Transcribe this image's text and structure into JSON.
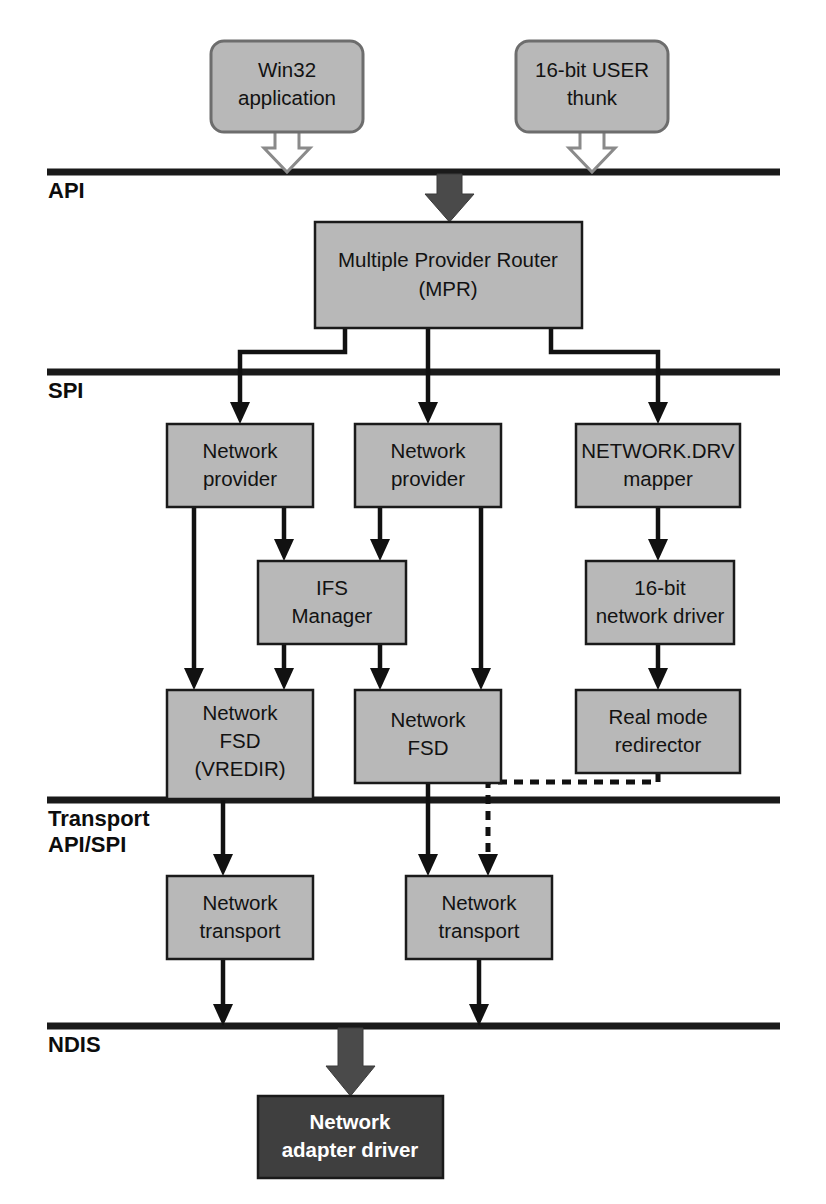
{
  "diagram": {
    "colors": {
      "box_fill": "#b8b8b8",
      "box_stroke": "#1a1a1a",
      "dark_box_fill": "#3f3f3f",
      "dark_box_text": "#ffffff",
      "rule": "#1a1a1a",
      "connector": "#111111",
      "hollow_arrow_fill": "#ffffff",
      "hollow_arrow_stroke": "#8a8a8a",
      "filled_block_arrow": "#4a4a4a",
      "background": "#ffffff"
    },
    "layers": [
      {
        "id": "api",
        "label": "API",
        "rule_y": 172,
        "label_y": 190
      },
      {
        "id": "spi",
        "label": "SPI",
        "rule_y": 372,
        "label_y": 390
      },
      {
        "id": "transport",
        "label": "Transport",
        "label2": "API/SPI",
        "rule_y": 800,
        "label_y": 818,
        "label2_y": 844
      },
      {
        "id": "ndis",
        "label": "NDIS",
        "rule_y": 1026,
        "label_y": 1045
      }
    ],
    "nodes": [
      {
        "id": "win32-application",
        "line1": "Win32",
        "line2": "application",
        "shape": "rounded",
        "x": 211,
        "y": 41,
        "w": 152,
        "h": 91
      },
      {
        "id": "sixteen-bit-user-thunk",
        "line1": "16-bit USER",
        "line2": "thunk",
        "shape": "rounded",
        "x": 516,
        "y": 41,
        "w": 152,
        "h": 91
      },
      {
        "id": "multiple-provider-router",
        "line1": "Multiple Provider Router",
        "line2": "(MPR)",
        "shape": "rect",
        "x": 315,
        "y": 222,
        "w": 267,
        "h": 106
      },
      {
        "id": "network-provider-left",
        "line1": "Network",
        "line2": "provider",
        "shape": "rect",
        "x": 167,
        "y": 424,
        "w": 146,
        "h": 83
      },
      {
        "id": "network-provider-center",
        "line1": "Network",
        "line2": "provider",
        "shape": "rect",
        "x": 355,
        "y": 424,
        "w": 146,
        "h": 83
      },
      {
        "id": "network-drv-mapper",
        "line1": "NETWORK.DRV",
        "line2": "mapper",
        "shape": "rect",
        "x": 576,
        "y": 424,
        "w": 164,
        "h": 83
      },
      {
        "id": "ifs-manager",
        "line1": "IFS",
        "line2": "Manager",
        "shape": "rect",
        "x": 258,
        "y": 561,
        "w": 148,
        "h": 83
      },
      {
        "id": "sixteen-bit-network-driver",
        "line1": "16-bit",
        "line2": "network driver",
        "shape": "rect",
        "x": 586,
        "y": 561,
        "w": 148,
        "h": 83
      },
      {
        "id": "network-fsd-vredir",
        "line1": "Network",
        "line2": "FSD",
        "line3": "(VREDIR)",
        "shape": "rect",
        "x": 167,
        "y": 690,
        "w": 146,
        "h": 109
      },
      {
        "id": "network-fsd",
        "line1": "Network",
        "line2": "FSD",
        "shape": "rect",
        "x": 355,
        "y": 690,
        "w": 146,
        "h": 93
      },
      {
        "id": "real-mode-redirector",
        "line1": "Real mode",
        "line2": "redirector",
        "shape": "rect",
        "x": 576,
        "y": 690,
        "w": 164,
        "h": 83
      },
      {
        "id": "network-transport-left",
        "line1": "Network",
        "line2": "transport",
        "shape": "rect",
        "x": 167,
        "y": 876,
        "w": 146,
        "h": 83
      },
      {
        "id": "network-transport-right",
        "line1": "Network",
        "line2": "transport",
        "shape": "rect",
        "x": 406,
        "y": 876,
        "w": 146,
        "h": 83
      },
      {
        "id": "network-adapter-driver",
        "line1": "Network",
        "line2": "adapter driver",
        "shape": "dark",
        "x": 258,
        "y": 1096,
        "w": 185,
        "h": 82
      }
    ],
    "connectors": [
      {
        "id": "win32-to-api",
        "kind": "block-arrow-hollow",
        "from": "win32-application",
        "to": "api-layer"
      },
      {
        "id": "thunk-to-api",
        "kind": "block-arrow-hollow",
        "from": "sixteen-bit-user-thunk",
        "to": "api-layer"
      },
      {
        "id": "api-to-mpr",
        "kind": "block-arrow-filled",
        "from": "api-layer",
        "to": "multiple-provider-router"
      },
      {
        "id": "mpr-to-network-provider-left",
        "kind": "elbow-arrow",
        "from": "multiple-provider-router",
        "to": "network-provider-left"
      },
      {
        "id": "mpr-to-network-provider-center",
        "kind": "straight-arrow",
        "from": "multiple-provider-router",
        "to": "network-provider-center"
      },
      {
        "id": "mpr-to-network-drv-mapper",
        "kind": "elbow-arrow",
        "from": "multiple-provider-router",
        "to": "network-drv-mapper"
      },
      {
        "id": "network-provider-left-to-fsd-vredir",
        "kind": "straight-arrow",
        "from": "network-provider-left",
        "to": "network-fsd-vredir"
      },
      {
        "id": "network-provider-left-to-ifs-manager",
        "kind": "straight-arrow",
        "from": "network-provider-left",
        "to": "ifs-manager"
      },
      {
        "id": "network-provider-center-to-ifs-manager",
        "kind": "straight-arrow",
        "from": "network-provider-center",
        "to": "ifs-manager"
      },
      {
        "id": "network-provider-center-to-network-fsd",
        "kind": "straight-arrow",
        "from": "network-provider-center",
        "to": "network-fsd"
      },
      {
        "id": "ifs-manager-to-fsd-vredir",
        "kind": "straight-arrow",
        "from": "ifs-manager",
        "to": "network-fsd-vredir"
      },
      {
        "id": "ifs-manager-to-network-fsd",
        "kind": "straight-arrow",
        "from": "ifs-manager",
        "to": "network-fsd"
      },
      {
        "id": "mapper-to-sixteen-bit-driver",
        "kind": "straight-arrow",
        "from": "network-drv-mapper",
        "to": "sixteen-bit-network-driver"
      },
      {
        "id": "sixteen-bit-driver-to-real-mode-redirector",
        "kind": "straight-arrow",
        "from": "sixteen-bit-network-driver",
        "to": "real-mode-redirector"
      },
      {
        "id": "fsd-vredir-to-transport-left",
        "kind": "straight-arrow",
        "from": "network-fsd-vredir",
        "to": "network-transport-left"
      },
      {
        "id": "network-fsd-to-transport-right",
        "kind": "straight-arrow",
        "from": "network-fsd",
        "to": "network-transport-right"
      },
      {
        "id": "real-mode-redirector-to-transport-right",
        "kind": "dashed-elbow-arrow",
        "from": "real-mode-redirector",
        "to": "network-transport-right"
      },
      {
        "id": "transport-left-to-ndis",
        "kind": "straight-arrow",
        "from": "network-transport-left",
        "to": "ndis-layer"
      },
      {
        "id": "transport-right-to-ndis",
        "kind": "straight-arrow",
        "from": "network-transport-right",
        "to": "ndis-layer"
      },
      {
        "id": "ndis-to-adapter-driver",
        "kind": "block-arrow-filled",
        "from": "ndis-layer",
        "to": "network-adapter-driver"
      }
    ]
  }
}
